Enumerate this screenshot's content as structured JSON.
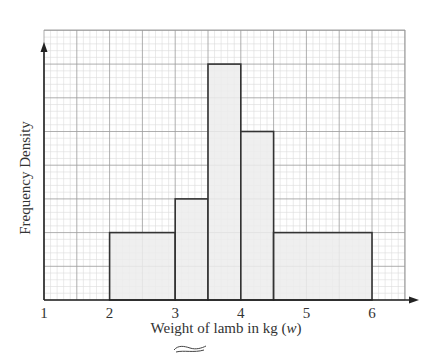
{
  "chart_data": {
    "type": "bar",
    "subtype": "histogram",
    "title": "",
    "xlabel": "Weight of lamb in kg (w)",
    "xlabel_main": "Weight of lamb in kg (",
    "xlabel_var": "w",
    "xlabel_close": ")",
    "ylabel": "Frequency Density",
    "xlim": [
      1,
      6.5
    ],
    "ylim": [
      0,
      8
    ],
    "x_ticks": [
      1,
      2,
      3,
      4,
      5,
      6
    ],
    "x_tick_labels": [
      "1",
      "2",
      "3",
      "4",
      "5",
      "6"
    ],
    "y_ticks_labeled": false,
    "grid": true,
    "grid_major_x": 0.5,
    "grid_major_y": 1,
    "grid_minor_divisions": 5,
    "legend": null,
    "bins": [
      {
        "x0": 2,
        "x1": 3,
        "frequency_density": 2
      },
      {
        "x0": 3,
        "x1": 3.5,
        "frequency_density": 3
      },
      {
        "x0": 3.5,
        "x1": 4,
        "frequency_density": 7
      },
      {
        "x0": 4,
        "x1": 4.5,
        "frequency_density": 5
      },
      {
        "x0": 4.5,
        "x1": 6,
        "frequency_density": 2
      }
    ],
    "categories": [
      "2-3",
      "3-3.5",
      "3.5-4",
      "4-4.5",
      "4.5-6"
    ],
    "values": [
      2,
      3,
      7,
      5,
      2
    ]
  },
  "colors": {
    "bar_fill": "#ececec",
    "bar_stroke": "#333333",
    "axis": "#222222",
    "grid_major": "#9a9a9a",
    "grid_minor": "#dcdcdc",
    "text": "#333333"
  }
}
